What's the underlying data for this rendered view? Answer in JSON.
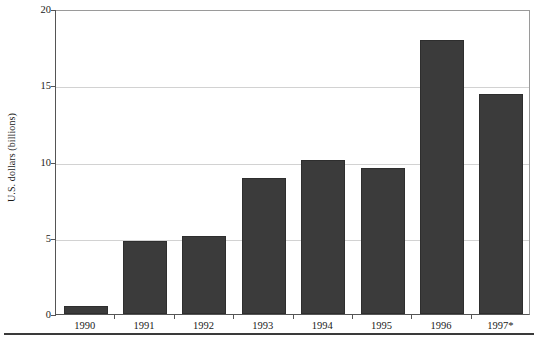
{
  "chart_data": {
    "type": "bar",
    "title": "",
    "subtitle": "",
    "xlabel": "",
    "ylabel": "U.S. dollars (billions)",
    "categories": [
      "1990",
      "1991",
      "1992",
      "1993",
      "1994",
      "1995",
      "1996",
      "1997*"
    ],
    "values": [
      0.55,
      4.8,
      5.1,
      8.9,
      10.1,
      9.6,
      18.0,
      14.4
    ],
    "ylim": [
      0,
      20
    ],
    "yticks": [
      0,
      5,
      10,
      15,
      20
    ],
    "ytick_labels": [
      "0",
      "5",
      "10",
      "15",
      "20"
    ],
    "grid": true,
    "grid_axis": "y",
    "legend": false,
    "legend_position": "none",
    "bar_color": "#3b3b3b",
    "bar_edge_color": "#2e2e2e",
    "gridline_color": "#d2d2d2",
    "axis_color": "#555555",
    "background_color": "#ffffff",
    "annotations": [
      "* denotes 1997 value is preliminary or estimated"
    ]
  },
  "axes": {
    "y_title": "U.S. dollars (billions)"
  }
}
